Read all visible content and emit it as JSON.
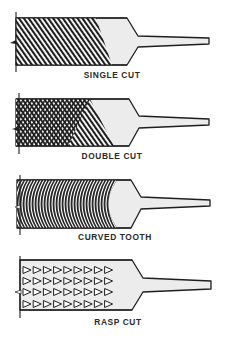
{
  "colors": {
    "ink": "#1e1e1e",
    "body_fill": "#ececec",
    "background": "#ffffff"
  },
  "files": [
    {
      "id": "single-cut",
      "label": "SINGLE CUT",
      "pattern": "single-diagonal-lines"
    },
    {
      "id": "double-cut",
      "label": "DOUBLE CUT",
      "pattern": "crosshatch"
    },
    {
      "id": "curved-tooth",
      "label": "CURVED TOOTH",
      "pattern": "concentric-arcs"
    },
    {
      "id": "rasp-cut",
      "label": "RASP CUT",
      "pattern": "triangle-teeth",
      "rows": 4,
      "teeth_per_row": 9
    }
  ]
}
